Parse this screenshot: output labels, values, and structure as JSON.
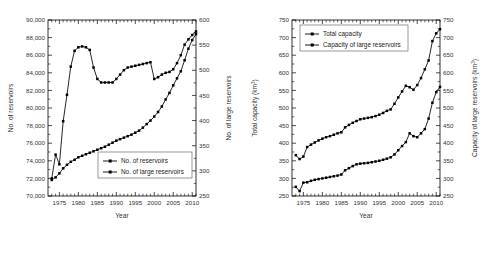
{
  "figure": {
    "panels": [
      "left",
      "right"
    ],
    "background": "#ffffff",
    "line_color": "#000000"
  },
  "chart_data": [
    {
      "id": "reservoir-counts",
      "type": "line",
      "title": "",
      "xlabel": "Year",
      "ylabel": "No. of reservoirs",
      "y2label": "No. of large reservoirs",
      "xlim": [
        1972,
        2011
      ],
      "ylim": [
        70000,
        90000
      ],
      "y2lim": [
        250,
        600
      ],
      "xticks": [
        1975,
        1980,
        1985,
        1990,
        1995,
        2000,
        2005,
        2010
      ],
      "yticks": [
        "70,000",
        "72,000",
        "74,000",
        "76,000",
        "78,000",
        "80,000",
        "82,000",
        "84,000",
        "86,000",
        "88,000",
        "90,000"
      ],
      "ytick_values": [
        70000,
        72000,
        74000,
        76000,
        78000,
        80000,
        82000,
        84000,
        86000,
        88000,
        90000
      ],
      "y2ticks": [
        250,
        300,
        350,
        400,
        450,
        500,
        550,
        600
      ],
      "grid": false,
      "legend_position": "lower right",
      "x": [
        1973,
        1974,
        1975,
        1976,
        1977,
        1978,
        1979,
        1980,
        1981,
        1982,
        1983,
        1984,
        1985,
        1986,
        1987,
        1988,
        1989,
        1990,
        1991,
        1992,
        1993,
        1994,
        1995,
        1996,
        1997,
        1998,
        1999,
        2000,
        2001,
        2002,
        2003,
        2004,
        2005,
        2006,
        2007,
        2008,
        2009,
        2010,
        2011
      ],
      "series": [
        {
          "name": "No. of reservoirs",
          "axis": "left",
          "values": [
            72000,
            74700,
            73600,
            78500,
            81500,
            84700,
            86500,
            86900,
            87000,
            86900,
            86600,
            84600,
            83300,
            82900,
            82900,
            82900,
            82900,
            83300,
            83800,
            84300,
            84600,
            84700,
            84800,
            84900,
            85000,
            85100,
            85200,
            83300,
            83500,
            83800,
            84000,
            84100,
            84400,
            85100,
            86000,
            87200,
            87800,
            88300,
            88700
          ]
        },
        {
          "name": "No. of large reservoirs",
          "axis": "right",
          "values": [
            282,
            287,
            295,
            305,
            312,
            318,
            322,
            327,
            330,
            333,
            336,
            339,
            342,
            345,
            348,
            352,
            356,
            360,
            363,
            366,
            369,
            372,
            376,
            380,
            386,
            393,
            400,
            408,
            417,
            428,
            442,
            455,
            470,
            484,
            498,
            520,
            543,
            560,
            572
          ]
        }
      ]
    },
    {
      "id": "reservoir-capacity",
      "type": "line",
      "title": "",
      "xlabel": "Year",
      "ylabel": "Total capacity (km³)",
      "y2label": "Capacity of large reservoirs (km³)",
      "xlim": [
        1972,
        2011
      ],
      "ylim": [
        250,
        750
      ],
      "y2lim": [
        250,
        750
      ],
      "xticks": [
        1975,
        1980,
        1985,
        1990,
        1995,
        2000,
        2005,
        2010
      ],
      "yticks": [
        250,
        300,
        350,
        400,
        450,
        500,
        550,
        600,
        650,
        700,
        750
      ],
      "y2ticks": [
        250,
        300,
        350,
        400,
        450,
        500,
        550,
        600,
        650,
        700,
        750
      ],
      "grid": false,
      "legend_position": "upper left",
      "x": [
        1973,
        1974,
        1975,
        1976,
        1977,
        1978,
        1979,
        1980,
        1981,
        1982,
        1983,
        1984,
        1985,
        1986,
        1987,
        1988,
        1989,
        1990,
        1991,
        1992,
        1993,
        1994,
        1995,
        1996,
        1997,
        1998,
        1999,
        2000,
        2001,
        2002,
        2003,
        2004,
        2005,
        2006,
        2007,
        2008,
        2009,
        2010,
        2011
      ],
      "series": [
        {
          "name": "Total capacity",
          "axis": "left",
          "values": [
            366,
            355,
            362,
            389,
            396,
            402,
            408,
            413,
            417,
            420,
            424,
            428,
            431,
            445,
            452,
            458,
            463,
            468,
            470,
            472,
            474,
            477,
            481,
            486,
            492,
            496,
            512,
            530,
            547,
            563,
            559,
            552,
            565,
            585,
            610,
            635,
            690,
            712,
            724
          ]
        },
        {
          "name": "Capacity of large reservoirs",
          "axis": "right",
          "values": [
            276,
            264,
            288,
            289,
            293,
            296,
            298,
            300,
            302,
            304,
            306,
            308,
            311,
            323,
            329,
            335,
            340,
            342,
            343,
            344,
            346,
            348,
            350,
            353,
            356,
            360,
            368,
            380,
            392,
            403,
            428,
            420,
            417,
            428,
            440,
            470,
            515,
            545,
            560
          ]
        }
      ]
    }
  ]
}
